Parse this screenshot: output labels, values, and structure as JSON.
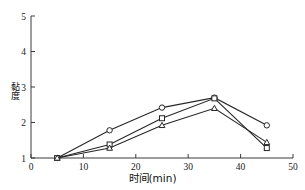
{
  "figure": {
    "background": "#ffffff",
    "line_color": "#262626",
    "axis_color": "#3a3a3a"
  },
  "axes": {
    "x_title": "时间(min)",
    "y_title": "黏度",
    "x_ticks": [
      "0",
      "10",
      "20",
      "30",
      "40",
      "50"
    ],
    "y_ticks": [
      "1",
      "2",
      "3",
      "4",
      "5"
    ]
  },
  "chart_data": {
    "type": "line",
    "title": "",
    "subtitle": "",
    "xlabel": "时间(min)",
    "ylabel": "黏度",
    "xlim": [
      0,
      50
    ],
    "ylim": [
      1,
      5
    ],
    "x_ticks": [
      0,
      10,
      20,
      30,
      40,
      50
    ],
    "y_ticks": [
      1,
      2,
      3,
      4,
      5
    ],
    "grid": false,
    "legend": null,
    "x": [
      5,
      15,
      25,
      35,
      45
    ],
    "series": [
      {
        "name": "series-circle",
        "marker": "circle",
        "values": [
          1.0,
          1.78,
          2.42,
          2.7,
          1.92
        ]
      },
      {
        "name": "series-square",
        "marker": "square",
        "values": [
          1.0,
          1.38,
          2.12,
          2.68,
          1.28
        ]
      },
      {
        "name": "series-triangle",
        "marker": "triangle",
        "values": [
          1.0,
          1.28,
          1.92,
          2.4,
          1.44
        ]
      }
    ],
    "annotations": []
  }
}
